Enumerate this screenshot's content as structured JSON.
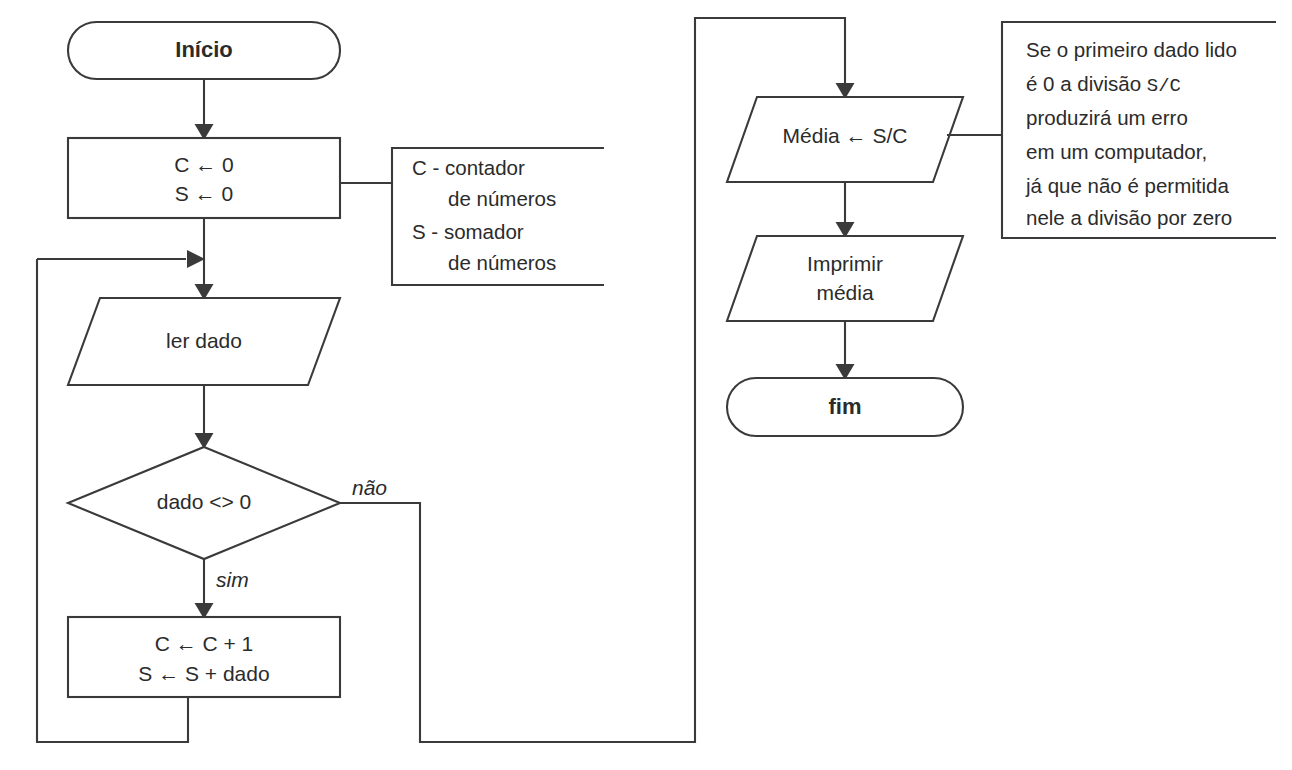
{
  "diagram": {
    "stroke_color": "#3a3a3a",
    "text_color": "#2b2b2b",
    "background_color": "#ffffff"
  },
  "nodes": {
    "start": {
      "label": "Início",
      "shape": "terminator"
    },
    "init": {
      "line1": "C ← 0",
      "line2": "S ← 0",
      "shape": "process"
    },
    "read": {
      "label": "ler dado",
      "shape": "input"
    },
    "decision": {
      "label": "dado <> 0",
      "shape": "decision"
    },
    "accumulate": {
      "line1": "C ← C + 1",
      "line2": "S ← S + dado",
      "shape": "process"
    },
    "average": {
      "label": "Média ← S/C",
      "shape": "process_parallelogram"
    },
    "print": {
      "line1": "Imprimir",
      "line2": "média",
      "shape": "output"
    },
    "end": {
      "label": "fim",
      "shape": "terminator"
    }
  },
  "branch_labels": {
    "no": "não",
    "yes": "sim"
  },
  "annotations": {
    "legend": {
      "lines": [
        "C - contador",
        "de números",
        "S - somador",
        "de números"
      ]
    },
    "note": {
      "line1_a": "Se o primeiro dado lido",
      "line2_a": "é 0 a divisão ",
      "line2_mono": "S/C",
      "line3": "produzirá um erro",
      "line4": "em um computador,",
      "line5": "já que não é permitida",
      "line6": "nele a divisão por zero"
    }
  }
}
